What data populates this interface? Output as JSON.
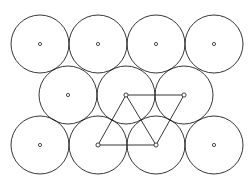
{
  "figure": {
    "background_color": "#ffffff",
    "stroke_color": "#231f20",
    "width": 251,
    "height": 191
  },
  "chart_data": {
    "type": "scatter",
    "xlabel": "",
    "ylabel": "",
    "xlim": [
      0,
      251
    ],
    "ylim": [
      0,
      191
    ],
    "grid": false,
    "legend": "none",
    "circle_radius": 29,
    "circle_spacing_x": 58,
    "circle_spacing_y": 50,
    "rows": [
      {
        "name": "row-1",
        "y": 44,
        "count": 4,
        "x": [
          40,
          98,
          156,
          214
        ]
      },
      {
        "name": "row-2",
        "y": 95,
        "count": 3,
        "x": [
          68,
          126,
          184
        ]
      },
      {
        "name": "row-3",
        "y": 145,
        "count": 4,
        "x": [
          40,
          98,
          156,
          214
        ]
      }
    ],
    "circles": [
      {
        "cx": 40,
        "cy": 44,
        "r": 29,
        "row": 1,
        "col": 1
      },
      {
        "cx": 98,
        "cy": 44,
        "r": 29,
        "row": 1,
        "col": 2
      },
      {
        "cx": 156,
        "cy": 44,
        "r": 29,
        "row": 1,
        "col": 3
      },
      {
        "cx": 214,
        "cy": 44,
        "r": 29,
        "row": 1,
        "col": 4
      },
      {
        "cx": 68,
        "cy": 95,
        "r": 29,
        "row": 2,
        "col": 1
      },
      {
        "cx": 126,
        "cy": 95,
        "r": 29,
        "row": 2,
        "col": 2
      },
      {
        "cx": 184,
        "cy": 95,
        "r": 29,
        "row": 2,
        "col": 3
      },
      {
        "cx": 40,
        "cy": 145,
        "r": 29,
        "row": 3,
        "col": 1
      },
      {
        "cx": 98,
        "cy": 145,
        "r": 29,
        "row": 3,
        "col": 2
      },
      {
        "cx": 156,
        "cy": 145,
        "r": 29,
        "row": 3,
        "col": 3
      },
      {
        "cx": 214,
        "cy": 145,
        "r": 29,
        "row": 3,
        "col": 4
      }
    ],
    "center_dot_radius": 1.6,
    "unit_cell": {
      "shape": "rhombus",
      "vertices": [
        {
          "name": "top-left",
          "x": 126,
          "y": 95
        },
        {
          "name": "top-right",
          "x": 184,
          "y": 95
        },
        {
          "name": "bottom-right",
          "x": 156,
          "y": 145
        },
        {
          "name": "bottom-left",
          "x": 98,
          "y": 145
        }
      ],
      "vertex_marker_radius": 2.1,
      "edges": [
        {
          "name": "top-edge",
          "x1": 126,
          "y1": 95,
          "x2": 184,
          "y2": 95
        },
        {
          "name": "right-edge",
          "x1": 184,
          "y1": 95,
          "x2": 156,
          "y2": 145
        },
        {
          "name": "bottom-edge",
          "x1": 156,
          "y1": 145,
          "x2": 98,
          "y2": 145
        },
        {
          "name": "left-edge",
          "x1": 98,
          "y1": 145,
          "x2": 126,
          "y2": 95
        },
        {
          "name": "diagonal-edge",
          "x1": 126,
          "y1": 95,
          "x2": 156,
          "y2": 145
        }
      ]
    }
  }
}
